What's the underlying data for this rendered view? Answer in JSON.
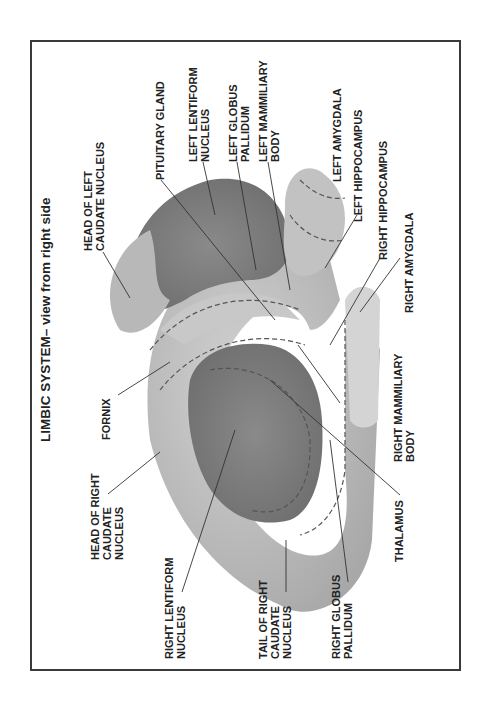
{
  "figure": {
    "title": "LIMBIC SYSTEM– view from right side",
    "orientation": "rotated 90deg counter-clockwise",
    "labels": {
      "head_left_caudate": "HEAD OF LEFT\nCAUDATE NUCLEUS",
      "pituitary_gland": "PITUITARY GLAND",
      "left_lentiform": "LEFT LENTIFORM\nNUCLEUS",
      "left_globus_pallidum": "LEFT GLOBUS\nPALLIDUM",
      "left_mammiliary": "LEFT MAMMILIARY\nBODY",
      "left_amygdala": "LEFT AMYGDALA",
      "left_hippocampus": "LEFT HIPPOCAMPUS",
      "right_hippocampus": "RIGHT HIPPOCAMPUS",
      "right_amygdala": "RIGHT AMYGDALA",
      "fornix": "FORNIX",
      "right_mammiliary": "RIGHT MAMMILIARY\nBODY",
      "head_right_caudate": "HEAD OF RIGHT\nCAUDATE\nNUCLEUS",
      "thalamus": "THALAMUS",
      "right_lentiform": "RIGHT LENTIFORM\nNUCLEUS",
      "tail_right_caudate": "TAIL OF RIGHT\nCAUDATE\nNUCLEUS",
      "right_globus_pallidum": "RIGHT GLOBUS\nPALLIDUM"
    }
  }
}
